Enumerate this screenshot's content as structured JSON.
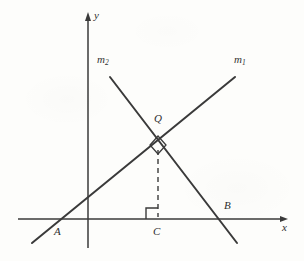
{
  "figure": {
    "kind": "coordinate-geometry-diagram",
    "background_color": "#fdfdfb",
    "stroke_color": "#3a3a3a",
    "axes": {
      "x_axis": {
        "label": "x",
        "label_pos": [
          283,
          226
        ],
        "x_start": 18,
        "x_end": 288,
        "y": 219,
        "arrow": "right"
      },
      "y_axis": {
        "label": "y",
        "label_pos": [
          95,
          13
        ],
        "x": 88,
        "y_top": 13,
        "y_bottom": 248,
        "arrow": "up"
      }
    },
    "lines": [
      {
        "name": "m1",
        "label": "m",
        "subscript": "1",
        "label_pos": [
          236,
          57
        ],
        "from": [
          32,
          243
        ],
        "to": [
          235,
          77
        ],
        "x_intercept_point": "A",
        "description": "rising line through A and Q"
      },
      {
        "name": "m2",
        "label": "m",
        "subscript": "2",
        "label_pos": [
          98,
          57
        ],
        "from": [
          110,
          77
        ],
        "to": [
          237,
          243
        ],
        "x_intercept_point": "B",
        "description": "falling line through Q and B"
      }
    ],
    "segments": [
      {
        "name": "QC",
        "style": "dashed",
        "from": [
          158,
          148
        ],
        "to": [
          158,
          217
        ],
        "description": "altitude from Q perpendicular to the x-axis at C"
      }
    ],
    "points": [
      {
        "name": "A",
        "label": "A",
        "at": [
          60,
          219
        ],
        "label_pos": [
          55,
          228
        ],
        "on": "x-axis"
      },
      {
        "name": "B",
        "label": "B",
        "at": [
          222,
          219
        ],
        "label_pos": [
          224,
          203
        ],
        "on": "x-axis"
      },
      {
        "name": "C",
        "label": "C",
        "at": [
          158,
          219
        ],
        "label_pos": [
          154,
          228
        ],
        "on": "x-axis"
      },
      {
        "name": "Q",
        "label": "Q",
        "at": [
          158,
          145
        ],
        "label_pos": [
          155,
          114
        ],
        "on": "intersection of m1 and m2"
      }
    ],
    "right_angle_marks": [
      {
        "name": "right-angle-at-Q",
        "at": [
          158,
          145
        ],
        "style": "diamond",
        "size": 9,
        "between": [
          "m1",
          "m2"
        ]
      },
      {
        "name": "right-angle-at-C",
        "at": [
          158,
          219
        ],
        "style": "square",
        "size": 10,
        "orientation": "upper-left",
        "between": [
          "QC",
          "x-axis"
        ]
      }
    ]
  }
}
